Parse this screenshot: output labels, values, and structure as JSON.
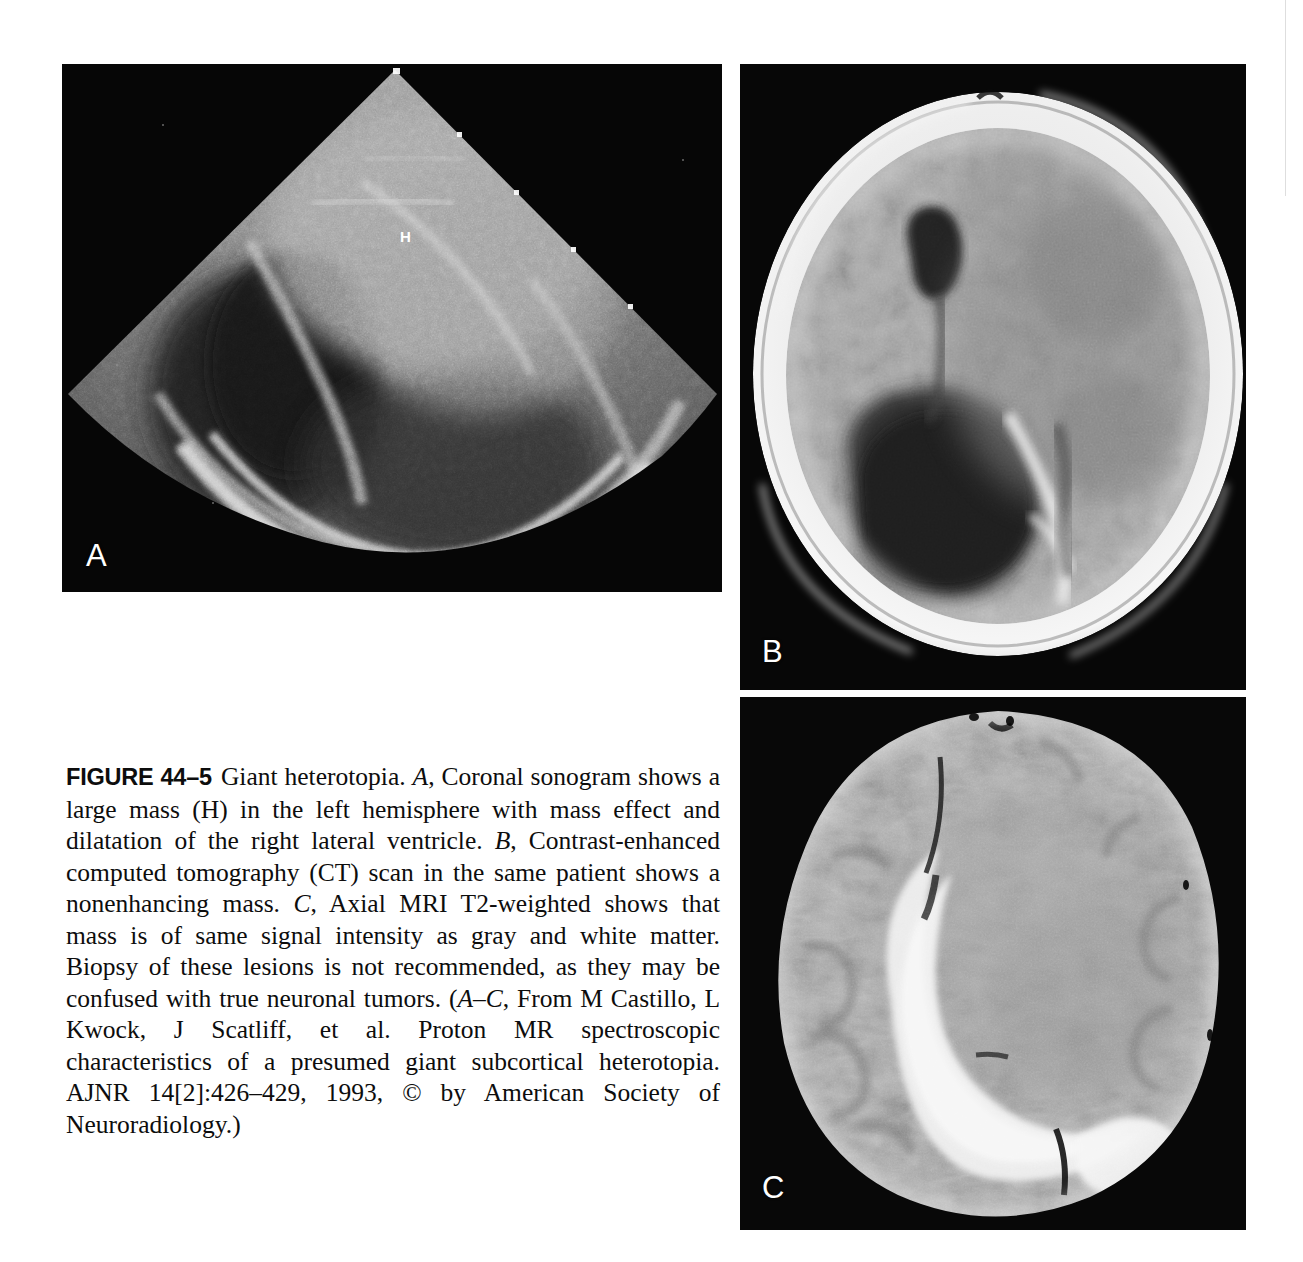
{
  "page": {
    "background_color": "#ffffff",
    "width": 1303,
    "height": 1262
  },
  "figure": {
    "number_label": "FIGURE 44–5",
    "title": "Giant heterotopia.",
    "caption_full": "FIGURE 44–5  Giant heterotopia. A, Coronal sonogram shows a large mass (H) in the left hemisphere with mass effect and dilatation of the right lateral ventricle. B, Contrast-enhanced computed tomography (CT) scan in the same patient shows a nonenhancing mass. C, Axial MRI T2-weighted shows that mass is of same signal intensity as gray and white matter. Biopsy of these lesions is not recommended, as they may be confused with true neuronal tumors. (A–C, From M Castillo, L Kwock, J Scatliff, et al. Proton MR spectroscopic characteristics of a presumed giant subcortical heterotopia. AJNR 14[2]:426–429, 1993, © by American Society of Neuroradiology.)",
    "caption_segments": {
      "part_a_marker": "A",
      "part_a_text": ", Coronal sonogram shows a large mass (H) in the left hemisphere with mass effect and dilatation of the right lateral ventricle. ",
      "part_b_marker": "B",
      "part_b_text": ", Contrast-enhanced computed tomography (CT) scan in the same patient shows a nonenhancing mass. ",
      "part_c_marker": "C",
      "part_c_text": ", Axial MRI T2-weighted shows that mass is of same signal intensity as gray and white matter. Biopsy of these lesions is not recommended, as they may be confused with true neuronal tumors. (",
      "source_marker": "A–C",
      "source_text": ", From M Castillo, L Kwock, J Scatliff, et al. Proton MR spectroscopic characteristics of a presumed giant subcortical heterotopia. AJNR 14[2]:426–429, 1993, © by American Society of Neuroradiology.)"
    }
  },
  "panels": [
    {
      "id": "A",
      "label": "A",
      "modality": "Coronal sonogram",
      "overlay_label": "H",
      "overlay_label_meaning": "large heterotopic mass in left hemisphere",
      "description": "Coronal cranial ultrasound, sector (fan-shaped) field of view with apex at top, on black background. Dilated right lateral ventricle and large echogenic mass."
    },
    {
      "id": "B",
      "label": "B",
      "modality": "Contrast-enhanced computed tomography (CT)",
      "description": "Axial CT of the head showing bright calvarium ring, mottled gray brain parenchyma, and two dark low-attenuation ventricular regions; nonenhancing mass."
    },
    {
      "id": "C",
      "label": "C",
      "modality": "Axial MRI T2-weighted",
      "description": "Axial T2-weighted MRI showing bright CSF-filled dilated ventricle as a crescent and mottled gray/white matter; mass isointense to gray and white matter."
    }
  ]
}
